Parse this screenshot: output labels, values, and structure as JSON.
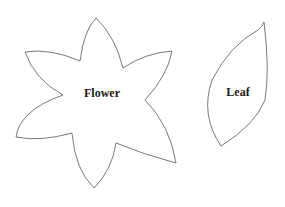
{
  "shapes": {
    "flower": {
      "label": "Flower",
      "petals": 6
    },
    "leaf": {
      "label": "Leaf"
    }
  },
  "colors": {
    "outline": "#555555",
    "label": "#1a1a1a",
    "background": "#ffffff"
  }
}
